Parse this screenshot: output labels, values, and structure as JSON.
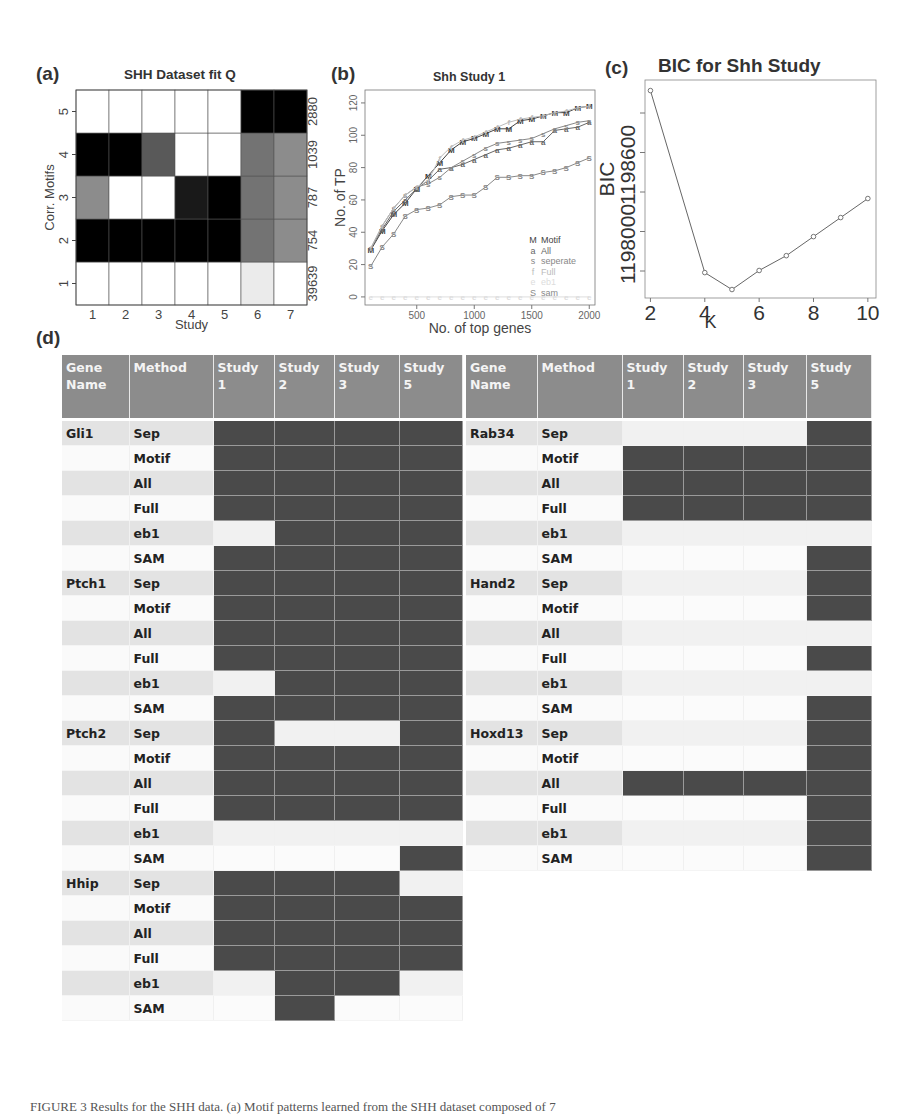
{
  "panels": {
    "a": {
      "label": "(a)",
      "title": "SHH Dataset fit Q"
    },
    "b": {
      "label": "(b)",
      "title": "Shh Study 1"
    },
    "c": {
      "label": "(c)",
      "title": "BIC for Shh Study"
    },
    "d": {
      "label": "(d)"
    }
  },
  "chart_data": [
    {
      "type": "heatmap",
      "panel": "a",
      "title": "SHH Dataset fit Q",
      "xlabel": "Study",
      "ylabel": "Corr. Motifs",
      "x_ticks": [
        "1",
        "2",
        "3",
        "4",
        "5",
        "6",
        "7"
      ],
      "y_ticks": [
        "1",
        "2",
        "3",
        "4",
        "5"
      ],
      "right_labels": [
        "39639",
        "754",
        "787",
        "1039",
        "2880"
      ],
      "rows_bottom_to_top": [
        [
          0.0,
          0.0,
          0.0,
          0.0,
          0.0,
          0.08,
          0.0
        ],
        [
          1.0,
          1.0,
          1.0,
          1.0,
          1.0,
          0.55,
          0.45
        ],
        [
          0.45,
          0.0,
          0.0,
          0.9,
          1.0,
          0.55,
          0.45
        ],
        [
          1.0,
          1.0,
          0.65,
          0.0,
          0.0,
          0.55,
          0.45
        ],
        [
          0.0,
          0.0,
          0.0,
          0.0,
          0.0,
          1.0,
          1.0
        ]
      ],
      "colormap": "white-to-black"
    },
    {
      "type": "line",
      "panel": "b",
      "title": "Shh Study 1",
      "xlabel": "No. of top genes",
      "ylabel": "No. of TP",
      "xlim": [
        50,
        2050
      ],
      "ylim": [
        -5,
        128
      ],
      "x_ticks": [
        500,
        1000,
        1500,
        2000
      ],
      "y_ticks": [
        0,
        20,
        40,
        60,
        80,
        100,
        120
      ],
      "x": [
        100,
        200,
        300,
        400,
        500,
        600,
        700,
        800,
        900,
        1000,
        1100,
        1200,
        1300,
        1400,
        1500,
        1600,
        1700,
        1800,
        1900,
        2000
      ],
      "series": [
        {
          "name": "Motif",
          "marker": "M",
          "color": "#444444",
          "values": [
            29,
            41,
            51,
            58,
            67,
            75,
            83,
            91,
            96,
            98,
            101,
            104,
            104,
            109,
            110,
            112,
            114,
            114,
            117,
            118
          ]
        },
        {
          "name": "All",
          "marker": "a",
          "color": "#666666",
          "values": [
            30,
            42,
            53,
            60,
            67,
            72,
            79,
            80,
            82,
            85,
            88,
            91,
            92,
            94,
            96,
            96,
            103,
            104,
            105,
            108
          ]
        },
        {
          "name": "seperate",
          "marker": "s",
          "color": "#888888",
          "values": [
            30,
            44,
            55,
            63,
            68,
            70,
            74,
            80,
            84,
            88,
            92,
            95,
            96,
            97,
            98,
            101,
            104,
            106,
            108,
            109
          ]
        },
        {
          "name": "Full",
          "marker": "f",
          "color": "#bbbbbb",
          "values": [
            30,
            44,
            55,
            63,
            68,
            72,
            86,
            93,
            97,
            99,
            102,
            105,
            108,
            110,
            111,
            112,
            114,
            115,
            117,
            118
          ]
        },
        {
          "name": "eb1",
          "marker": "e",
          "color": "#dddddd",
          "values": [
            0,
            0,
            0,
            0,
            0,
            0,
            0,
            0,
            0,
            0,
            0,
            0,
            0,
            0,
            0,
            0,
            0,
            0,
            0,
            0
          ]
        },
        {
          "name": "sam",
          "marker": "S",
          "color": "#888888",
          "values": [
            19,
            31,
            39,
            50,
            54,
            55,
            57,
            62,
            63,
            63,
            68,
            74,
            74,
            75,
            75,
            77,
            78,
            80,
            83,
            86
          ]
        }
      ],
      "legend": [
        "Motif",
        "All",
        "seperate",
        "Full",
        "eb1",
        "sam"
      ],
      "legend_position": "bottom-right"
    },
    {
      "type": "line",
      "panel": "c",
      "title": "BIC for Shh Study",
      "xlabel": "K",
      "ylabel": "BIC",
      "x": [
        2,
        4,
        5,
        6,
        7,
        8,
        9,
        10
      ],
      "values": [
        1198840,
        1197980,
        1197900,
        1197990,
        1198060,
        1198150,
        1198240,
        1198330
      ],
      "xlim": [
        1.8,
        10.3
      ],
      "ylim": [
        1197860,
        1198890
      ],
      "x_ticks": [
        2,
        4,
        6,
        8,
        10
      ],
      "y_ticks": [
        1198000,
        1198600
      ],
      "y_tick_marks": [
        1197800,
        1198000,
        1198200,
        1198400,
        1198600
      ]
    }
  ],
  "table": {
    "headers": [
      {
        "l1": "Gene",
        "l2": "Name"
      },
      {
        "l1": "Method",
        "l2": ""
      },
      {
        "l1": "Study",
        "l2": "1"
      },
      {
        "l1": "Study",
        "l2": "2"
      },
      {
        "l1": "Study",
        "l2": "3"
      },
      {
        "l1": "Study",
        "l2": "5"
      }
    ],
    "left": [
      {
        "gene": "Gli1",
        "method": "Sep",
        "s": [
          1,
          1,
          1,
          1
        ]
      },
      {
        "gene": "",
        "method": "Motif",
        "s": [
          1,
          1,
          1,
          1
        ]
      },
      {
        "gene": "",
        "method": "All",
        "s": [
          1,
          1,
          1,
          1
        ]
      },
      {
        "gene": "",
        "method": "Full",
        "s": [
          1,
          1,
          1,
          1
        ]
      },
      {
        "gene": "",
        "method": "eb1",
        "s": [
          0,
          1,
          1,
          1
        ]
      },
      {
        "gene": "",
        "method": "SAM",
        "s": [
          1,
          1,
          1,
          1
        ]
      },
      {
        "gene": "Ptch1",
        "method": "Sep",
        "s": [
          1,
          1,
          1,
          1
        ]
      },
      {
        "gene": "",
        "method": "Motif",
        "s": [
          1,
          1,
          1,
          1
        ]
      },
      {
        "gene": "",
        "method": "All",
        "s": [
          1,
          1,
          1,
          1
        ]
      },
      {
        "gene": "",
        "method": "Full",
        "s": [
          1,
          1,
          1,
          1
        ]
      },
      {
        "gene": "",
        "method": "eb1",
        "s": [
          0,
          1,
          1,
          1
        ]
      },
      {
        "gene": "",
        "method": "SAM",
        "s": [
          1,
          1,
          1,
          1
        ]
      },
      {
        "gene": "Ptch2",
        "method": "Sep",
        "s": [
          1,
          0,
          0,
          1
        ]
      },
      {
        "gene": "",
        "method": "Motif",
        "s": [
          1,
          1,
          1,
          1
        ]
      },
      {
        "gene": "",
        "method": "All",
        "s": [
          1,
          1,
          1,
          1
        ]
      },
      {
        "gene": "",
        "method": "Full",
        "s": [
          1,
          1,
          1,
          1
        ]
      },
      {
        "gene": "",
        "method": "eb1",
        "s": [
          0,
          0,
          0,
          0
        ]
      },
      {
        "gene": "",
        "method": "SAM",
        "s": [
          0,
          0,
          0,
          1
        ]
      },
      {
        "gene": "Hhip",
        "method": "Sep",
        "s": [
          1,
          1,
          1,
          0
        ]
      },
      {
        "gene": "",
        "method": "Motif",
        "s": [
          1,
          1,
          1,
          1
        ]
      },
      {
        "gene": "",
        "method": "All",
        "s": [
          1,
          1,
          1,
          1
        ]
      },
      {
        "gene": "",
        "method": "Full",
        "s": [
          1,
          1,
          1,
          1
        ]
      },
      {
        "gene": "",
        "method": "eb1",
        "s": [
          0,
          1,
          1,
          0
        ]
      },
      {
        "gene": "",
        "method": "SAM",
        "s": [
          0,
          1,
          0,
          0
        ]
      }
    ],
    "right": [
      {
        "gene": "Rab34",
        "method": "Sep",
        "s": [
          0,
          0,
          0,
          1
        ]
      },
      {
        "gene": "",
        "method": "Motif",
        "s": [
          1,
          1,
          1,
          1
        ]
      },
      {
        "gene": "",
        "method": "All",
        "s": [
          1,
          1,
          1,
          1
        ]
      },
      {
        "gene": "",
        "method": "Full",
        "s": [
          1,
          1,
          1,
          1
        ]
      },
      {
        "gene": "",
        "method": "eb1",
        "s": [
          0,
          0,
          0,
          0
        ]
      },
      {
        "gene": "",
        "method": "SAM",
        "s": [
          0,
          0,
          0,
          1
        ]
      },
      {
        "gene": "Hand2",
        "method": "Sep",
        "s": [
          0,
          0,
          0,
          1
        ]
      },
      {
        "gene": "",
        "method": "Motif",
        "s": [
          0,
          0,
          0,
          1
        ]
      },
      {
        "gene": "",
        "method": "All",
        "s": [
          0,
          0,
          0,
          0
        ]
      },
      {
        "gene": "",
        "method": "Full",
        "s": [
          0,
          0,
          0,
          1
        ]
      },
      {
        "gene": "",
        "method": "eb1",
        "s": [
          0,
          0,
          0,
          0
        ]
      },
      {
        "gene": "",
        "method": "SAM",
        "s": [
          0,
          0,
          0,
          1
        ]
      },
      {
        "gene": "Hoxd13",
        "method": "Sep",
        "s": [
          0,
          0,
          0,
          1
        ]
      },
      {
        "gene": "",
        "method": "Motif",
        "s": [
          0,
          0,
          0,
          1
        ]
      },
      {
        "gene": "",
        "method": "All",
        "s": [
          1,
          1,
          1,
          1
        ]
      },
      {
        "gene": "",
        "method": "Full",
        "s": [
          0,
          0,
          0,
          1
        ]
      },
      {
        "gene": "",
        "method": "eb1",
        "s": [
          0,
          0,
          0,
          1
        ]
      },
      {
        "gene": "",
        "method": "SAM",
        "s": [
          0,
          0,
          0,
          1
        ]
      }
    ]
  },
  "caption": "FIGURE 3   Results for the SHH data. (a) Motif patterns learned from the SHH dataset composed of 7"
}
